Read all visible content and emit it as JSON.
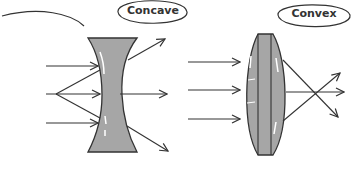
{
  "diagram": {
    "type": "lens-ray-diagram",
    "lenses": [
      {
        "name": "concave",
        "label": "Concave",
        "behavior": "diverging",
        "incoming_rays": 3,
        "outgoing_rays": 3
      },
      {
        "name": "convex",
        "label": "Convex",
        "behavior": "converging",
        "incoming_rays": 3,
        "outgoing_rays": 3
      }
    ],
    "colors": {
      "lens_fill": "#a6a6a6",
      "stroke": "#333333",
      "background": "#ffffff"
    }
  }
}
